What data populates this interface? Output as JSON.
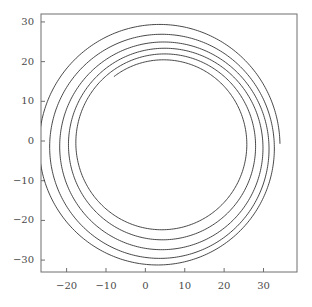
{
  "figure": {
    "background_color": "#ffffff",
    "frame_color": "#6e6e6e",
    "line_color": "#333333",
    "tick_label_color": "#4a4a4a",
    "title": "",
    "plot_box": {
      "left": 41,
      "top": 14,
      "right": 297,
      "bottom": 272
    }
  },
  "chart_data": {
    "type": "line",
    "title": "",
    "subtitle": "",
    "xlabel": "",
    "ylabel": "",
    "annotations": [],
    "legend": {
      "entries": [],
      "position": "none"
    },
    "grid": false,
    "xlim": [
      -26.5,
      38.5
    ],
    "ylim": [
      -33.0,
      32.0
    ],
    "xticks": [
      -20,
      -10,
      0,
      10,
      20,
      30
    ],
    "xtick_labels": [
      "−20",
      "−10",
      "0",
      "10",
      "20",
      "30"
    ],
    "yticks": [
      -30,
      -20,
      -10,
      0,
      10,
      20,
      30
    ],
    "ytick_labels": [
      "−30",
      "−20",
      "−10",
      "0",
      "10",
      "20",
      "30"
    ],
    "series": [
      {
        "name": "orbit-spiral",
        "color": "#333333",
        "linewidth": 0.9,
        "model": "decaying-eccentric-orbit",
        "turns": 5.35,
        "theta_start_deg": 0,
        "theta_end_deg": 1926,
        "center_x": 5.6,
        "center_y": -0.6,
        "semi_major_start": 31.2,
        "semi_major_end": 20.6,
        "eccentricity_start": 0.085,
        "eccentricity_end": 0.018,
        "apsis_angle_start_deg": 8,
        "apsis_precession_per_turn_deg": 26,
        "center_drift_x": -1.6,
        "center_drift_y": 0.5,
        "samples": 1700,
        "radial_extremes": {
          "max_x": 37.0,
          "min_x": -24.3,
          "max_y": 30.2,
          "min_y": -30.4
        },
        "right_crossings_y0": [
          37.0,
          33.2,
          29.8,
          26.8,
          23.4,
          21.6
        ],
        "left_crossings_y0": [
          -24.3,
          -23.0,
          -21.9,
          -20.6,
          -19.6,
          -19.0
        ],
        "top_crossings_x0": [
          30.2,
          26.1,
          23.0,
          20.6,
          19.9
        ],
        "bottom_crossings_x0": [
          -30.4,
          -25.9,
          -23.2,
          -21.0,
          -20.2
        ]
      }
    ]
  }
}
